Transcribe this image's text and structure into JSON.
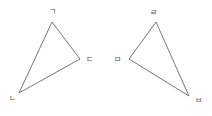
{
  "triangles": [
    {
      "name": "left-triangle",
      "vertices": [
        {
          "label": "ㄱ",
          "x": 52,
          "y": 22,
          "lx": 52,
          "ly": 14
        },
        {
          "label": "ㄷ",
          "x": 80,
          "y": 59,
          "lx": 89,
          "ly": 62
        },
        {
          "label": "ㄴ",
          "x": 19,
          "y": 93,
          "lx": 12,
          "ly": 101
        }
      ]
    },
    {
      "name": "right-triangle",
      "vertices": [
        {
          "label": "ㄹ",
          "x": 156,
          "y": 22,
          "lx": 153,
          "ly": 15
        },
        {
          "label": "ㅁ",
          "x": 129,
          "y": 59,
          "lx": 117,
          "ly": 62
        },
        {
          "label": "ㅂ",
          "x": 189,
          "y": 96,
          "lx": 198,
          "ly": 103
        }
      ]
    }
  ],
  "colors": {
    "edge": "#777777",
    "label": "#555555"
  }
}
